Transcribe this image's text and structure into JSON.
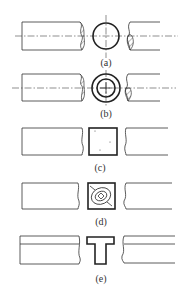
{
  "figure": {
    "panels": [
      {
        "id": "a",
        "label": "(a)",
        "section": "solid round bar"
      },
      {
        "id": "b",
        "label": "(b)",
        "section": "hollow tube"
      },
      {
        "id": "c",
        "label": "(c)",
        "section": "square bar, wood-grain hatching"
      },
      {
        "id": "d",
        "label": "(d)",
        "section": "square timber with end grain"
      },
      {
        "id": "e",
        "label": "(e)",
        "section": "T-section"
      }
    ]
  },
  "colors": {
    "line": "#333333",
    "background": "#ffffff"
  }
}
